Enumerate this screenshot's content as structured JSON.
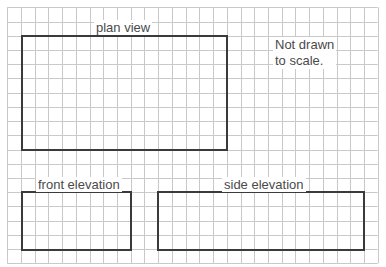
{
  "grid": {
    "columns": 27,
    "rows": 18,
    "line_color": "#c9c9c9"
  },
  "box_color": "#3a3a3a",
  "text_color": "#4a4a4a",
  "boxes": {
    "plan": {
      "label": "plan view"
    },
    "front": {
      "label": "front elevation"
    },
    "side": {
      "label": "side elevation"
    }
  },
  "note": {
    "line1": "Not drawn",
    "line2": "to scale."
  }
}
